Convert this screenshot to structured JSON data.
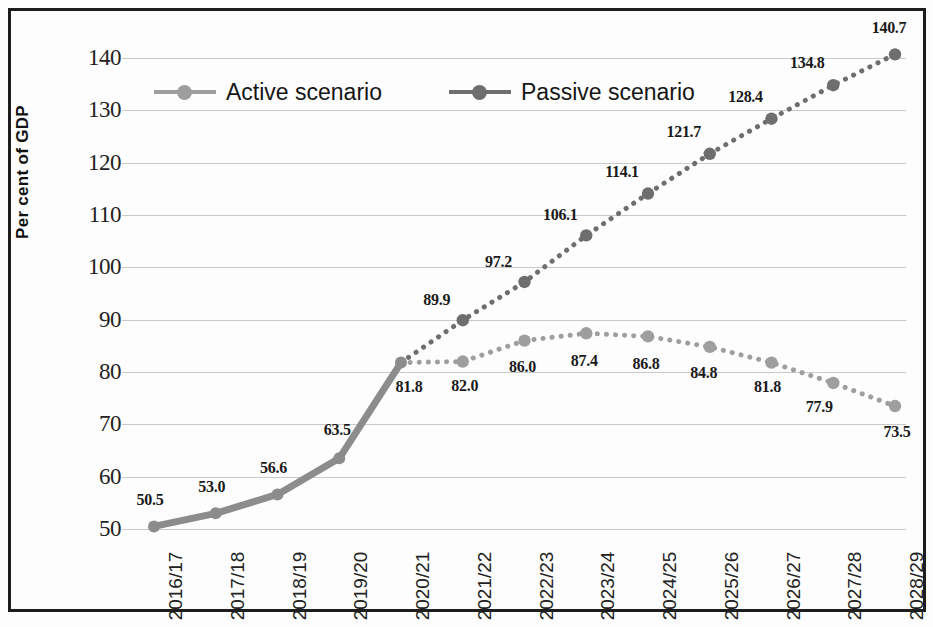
{
  "chart_data": {
    "type": "line",
    "title": "",
    "xlabel": "",
    "ylabel": "Per cent of GDP",
    "ylim": [
      50,
      140
    ],
    "ytick_step": 10,
    "yticks": [
      "140",
      "130",
      "120",
      "110",
      "100",
      "90",
      "80",
      "70",
      "60",
      "50"
    ],
    "grid": true,
    "legend_position": "top-left-inside",
    "categories": [
      "2016/17",
      "2017/18",
      "2018/19",
      "2019/20",
      "2020/21",
      "2021/22",
      "2022/23",
      "2023/24",
      "2024/25",
      "2025/26",
      "2026/27",
      "2027/28",
      "2028/29"
    ],
    "series": [
      {
        "name": "Active scenario",
        "color": "#9e9e9e",
        "style": "dotted",
        "values": [
          50.5,
          53.0,
          56.6,
          63.5,
          81.8,
          82.0,
          86.0,
          87.4,
          86.8,
          84.8,
          81.8,
          77.9,
          73.5
        ],
        "labels": [
          "50.5",
          "53.0",
          "56.6",
          "63.5",
          "81.8",
          "82.0",
          "86.0",
          "87.4",
          "86.8",
          "84.8",
          "81.8",
          "77.9",
          "73.5"
        ]
      },
      {
        "name": "Passive scenario",
        "color": "#6e6e6e",
        "style": "dotted",
        "values": [
          50.5,
          53.0,
          56.6,
          63.5,
          81.8,
          89.9,
          97.2,
          106.1,
          114.1,
          121.7,
          128.4,
          134.8,
          140.7
        ],
        "labels": [
          "50.5",
          "53.0",
          "56.6",
          "63.5",
          "81.8",
          "89.9",
          "97.2",
          "106.1",
          "114.1",
          "121.7",
          "128.4",
          "134.8",
          "140.7"
        ]
      }
    ],
    "history_end_index": 4,
    "history_note": "Solid thick line for 2016/17-2020/21 shared by both scenarios",
    "point_labels": [
      {
        "text": "50.5",
        "cat": "2016/17",
        "value": 50.5,
        "series": "shared"
      },
      {
        "text": "53.0",
        "cat": "2017/18",
        "value": 53.0,
        "series": "shared"
      },
      {
        "text": "56.6",
        "cat": "2018/19",
        "value": 56.6,
        "series": "shared"
      },
      {
        "text": "63.5",
        "cat": "2019/20",
        "value": 63.5,
        "series": "shared"
      },
      {
        "text": "81.8",
        "cat": "2020/21",
        "value": 81.8,
        "series": "shared"
      },
      {
        "text": "89.9",
        "cat": "2021/22",
        "value": 89.9,
        "series": "Passive scenario"
      },
      {
        "text": "97.2",
        "cat": "2022/23",
        "value": 97.2,
        "series": "Passive scenario"
      },
      {
        "text": "106.1",
        "cat": "2023/24",
        "value": 106.1,
        "series": "Passive scenario"
      },
      {
        "text": "114.1",
        "cat": "2024/25",
        "value": 114.1,
        "series": "Passive scenario"
      },
      {
        "text": "121.7",
        "cat": "2025/26",
        "value": 121.7,
        "series": "Passive scenario"
      },
      {
        "text": "128.4",
        "cat": "2026/27",
        "value": 128.4,
        "series": "Passive scenario"
      },
      {
        "text": "134.8",
        "cat": "2027/28",
        "value": 134.8,
        "series": "Passive scenario"
      },
      {
        "text": "140.7",
        "cat": "2028/29",
        "value": 140.7,
        "series": "Passive scenario"
      },
      {
        "text": "82.0",
        "cat": "2021/22",
        "value": 82.0,
        "series": "Active scenario"
      },
      {
        "text": "86.0",
        "cat": "2022/23",
        "value": 86.0,
        "series": "Active scenario"
      },
      {
        "text": "87.4",
        "cat": "2023/24",
        "value": 87.4,
        "series": "Active scenario"
      },
      {
        "text": "86.8",
        "cat": "2024/25",
        "value": 86.8,
        "series": "Active scenario"
      },
      {
        "text": "84.8",
        "cat": "2025/26",
        "value": 84.8,
        "series": "Active scenario"
      },
      {
        "text": "81.8",
        "cat": "2026/27",
        "value": 81.8,
        "series": "Active scenario"
      },
      {
        "text": "77.9",
        "cat": "2027/28",
        "value": 77.9,
        "series": "Active scenario"
      },
      {
        "text": "73.5",
        "cat": "2028/29",
        "value": 73.5,
        "series": "Active scenario"
      }
    ]
  },
  "legend": {
    "items": [
      {
        "label": "Active scenario",
        "color": "#9e9e9e"
      },
      {
        "label": "Passive scenario",
        "color": "#6e6e6e"
      }
    ]
  },
  "axis": {
    "y_title": "Per cent of GDP"
  },
  "colors": {
    "active": "#9e9e9e",
    "passive": "#6e6e6e",
    "history": "#8c8c8c",
    "grid": "#c9c9c9",
    "frame": "#1d1d1d",
    "text": "#1a1a1a"
  }
}
